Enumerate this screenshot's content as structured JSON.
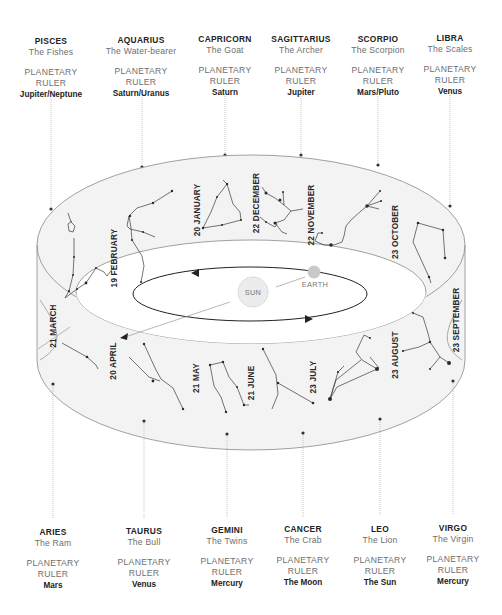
{
  "top_signs": [
    {
      "name": "PISCES",
      "symbol": "The Fishes",
      "ruler_label_1": "PLANETARY",
      "ruler_label_2": "RULER",
      "ruler": "Jupiter/Neptune",
      "x": 51,
      "y": 36
    },
    {
      "name": "AQUARIUS",
      "symbol": "The Water-bearer",
      "ruler_label_1": "PLANETARY",
      "ruler_label_2": "RULER",
      "ruler": "Saturn/Uranus",
      "x": 141,
      "y": 35
    },
    {
      "name": "CAPRICORN",
      "symbol": "The Goat",
      "ruler_label_1": "PLANETARY",
      "ruler_label_2": "RULER",
      "ruler": "Saturn",
      "x": 225,
      "y": 34
    },
    {
      "name": "SAGITTARIUS",
      "symbol": "The Archer",
      "ruler_label_1": "PLANETARY",
      "ruler_label_2": "RULER",
      "ruler": "Jupiter",
      "x": 301,
      "y": 34
    },
    {
      "name": "SCORPIO",
      "symbol": "The Scorpion",
      "ruler_label_1": "PLANETARY",
      "ruler_label_2": "RULER",
      "ruler": "Mars/Pluto",
      "x": 378,
      "y": 34
    },
    {
      "name": "LIBRA",
      "symbol": "The Scales",
      "ruler_label_1": "PLANETARY",
      "ruler_label_2": "RULER",
      "ruler": "Venus",
      "x": 450,
      "y": 33
    }
  ],
  "bottom_signs": [
    {
      "name": "ARIES",
      "symbol": "The Ram",
      "ruler_label_1": "PLANETARY",
      "ruler_label_2": "RULER",
      "ruler": "Mars",
      "x": 53,
      "y": 527
    },
    {
      "name": "TAURUS",
      "symbol": "The Bull",
      "ruler_label_1": "PLANETARY",
      "ruler_label_2": "RULER",
      "ruler": "Venus",
      "x": 144,
      "y": 526
    },
    {
      "name": "GEMINI",
      "symbol": "The Twins",
      "ruler_label_1": "PLANETARY",
      "ruler_label_2": "RULER",
      "ruler": "Mercury",
      "x": 227,
      "y": 525
    },
    {
      "name": "CANCER",
      "symbol": "The Crab",
      "ruler_label_1": "PLANETARY",
      "ruler_label_2": "RULER",
      "ruler": "The Moon",
      "x": 303,
      "y": 524
    },
    {
      "name": "LEO",
      "symbol": "The Lion",
      "ruler_label_1": "PLANETARY",
      "ruler_label_2": "RULER",
      "ruler": "The Sun",
      "x": 380,
      "y": 524
    },
    {
      "name": "VIRGO",
      "symbol": "The Virgin",
      "ruler_label_1": "PLANETARY",
      "ruler_label_2": "RULER",
      "ruler": "Mercury",
      "x": 453,
      "y": 523
    }
  ],
  "dates": {
    "d_feb": "19 FEBRUARY",
    "d_jan": "20 JANUARY",
    "d_dec": "22 DECEMBER",
    "d_nov": "22 NOVEMBER",
    "d_oct": "23 OCTOBER",
    "d_sep": "23 SEPTEMBER",
    "d_aug": "23 AUGUST",
    "d_jul": "23 JULY",
    "d_jun": "21 JUNE",
    "d_may": "21 MAY",
    "d_apr": "20 APRIL",
    "d_mar": "21 MARCH"
  },
  "center": {
    "sun_label": "SUN",
    "earth_label": "EARTH"
  },
  "colors": {
    "band_fill": "#f3f3f3",
    "outline": "#8a8a8a",
    "constellation": "#3a3a3a",
    "sun_fill": "#ececec",
    "earth_fill": "#c8c8c8",
    "leader": "#b5b5b5"
  }
}
